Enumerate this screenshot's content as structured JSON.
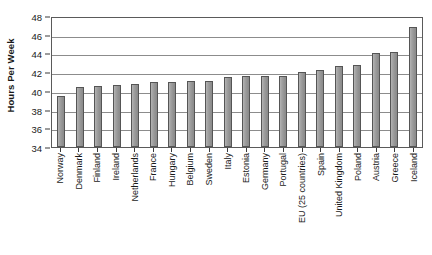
{
  "chart_data": {
    "type": "bar",
    "title": "",
    "xlabel": "",
    "ylabel": "Hours Per Week",
    "ylim": [
      34,
      48
    ],
    "ytick_step": 2,
    "yticks": [
      48,
      46,
      44,
      42,
      40,
      38,
      36,
      34
    ],
    "gridlines": true,
    "grid_axis": "y",
    "legend": false,
    "bar_color": "#9a9a9a",
    "bar_border_color": "#555555",
    "gridline_color": "#8c8c8c",
    "axis_color": "#5a5a5a",
    "categories": [
      "Norway",
      "Denmark",
      "Finland",
      "Ireland",
      "Netherlands",
      "France",
      "Hungary",
      "Belgium",
      "Sweden",
      "Italy",
      "Estonia",
      "Germany",
      "Portugal",
      "EU (25 countries)",
      "Spain",
      "United Kingdom",
      "Poland",
      "Austria",
      "Greece",
      "Iceland"
    ],
    "values": [
      39.4,
      40.4,
      40.5,
      40.6,
      40.7,
      40.9,
      41.0,
      41.1,
      41.1,
      41.5,
      41.6,
      41.6,
      41.6,
      42.0,
      42.2,
      42.7,
      42.8,
      44.0,
      44.2,
      46.8
    ]
  }
}
